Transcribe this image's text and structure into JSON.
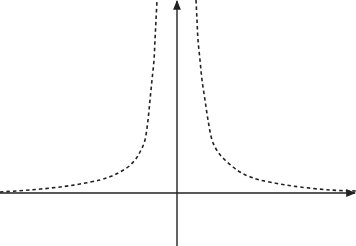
{
  "chart_data": {
    "type": "line",
    "title": "",
    "xlabel": "",
    "ylabel": "",
    "grid": false,
    "legend": null,
    "series": [
      {
        "name": "left branch",
        "style": "dashed",
        "color": "#222222",
        "pixel_points": [
          [
            0,
            192
          ],
          [
            30,
            190
          ],
          [
            60,
            187
          ],
          [
            80,
            184
          ],
          [
            100,
            180
          ],
          [
            112,
            176
          ],
          [
            120,
            172
          ],
          [
            128,
            167
          ],
          [
            135,
            160
          ],
          [
            140,
            152
          ],
          [
            145,
            140
          ],
          [
            148,
            120
          ],
          [
            150,
            100
          ],
          [
            152,
            80
          ],
          [
            154,
            60
          ],
          [
            155,
            40
          ],
          [
            156,
            20
          ],
          [
            157,
            0
          ]
        ]
      },
      {
        "name": "right branch",
        "style": "dashed",
        "color": "#222222",
        "pixel_points": [
          [
            196,
            0
          ],
          [
            197,
            20
          ],
          [
            198,
            40
          ],
          [
            200,
            60
          ],
          [
            202,
            80
          ],
          [
            205,
            100
          ],
          [
            208,
            120
          ],
          [
            212,
            140
          ],
          [
            218,
            152
          ],
          [
            225,
            160
          ],
          [
            233,
            167
          ],
          [
            240,
            172
          ],
          [
            248,
            176
          ],
          [
            260,
            180
          ],
          [
            280,
            184
          ],
          [
            300,
            187
          ],
          [
            330,
            190
          ],
          [
            356,
            191
          ]
        ]
      }
    ],
    "axes": {
      "origin_px": [
        177,
        193
      ],
      "x_axis": {
        "from_px": 0,
        "to_px": 356,
        "arrow": "right"
      },
      "y_axis": {
        "from_px": 246,
        "to_px": 0,
        "arrow": "up"
      },
      "color": "#222222"
    }
  }
}
